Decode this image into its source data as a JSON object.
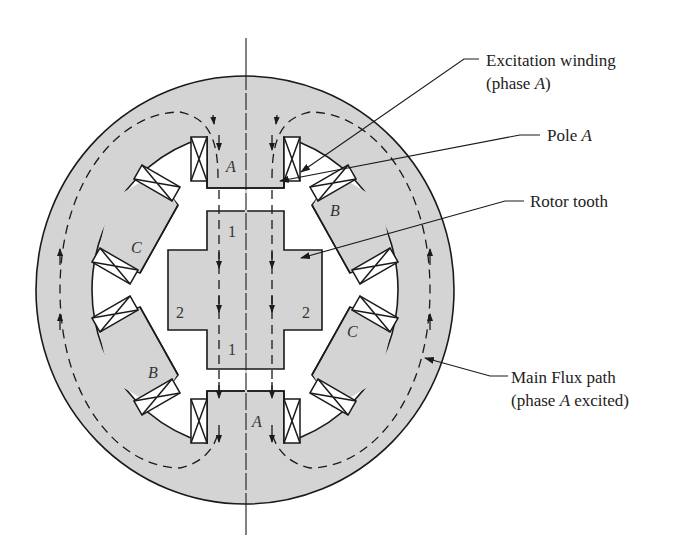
{
  "colors": {
    "iron": "#d4d4d4",
    "outline": "#1a1a1a",
    "background": "#ffffff"
  },
  "callouts": {
    "excitation_winding": {
      "line1": "Excitation winding",
      "line2_prefix": "(phase ",
      "line2_italic": "A",
      "line2_suffix": ")"
    },
    "pole_a": {
      "prefix": "Pole ",
      "italic": "A"
    },
    "rotor_tooth": {
      "text": "Rotor tooth"
    },
    "main_flux_path": {
      "line1": "Main Flux path",
      "line2_prefix": "(phase ",
      "line2_italic": "A",
      "line2_suffix": " excited)"
    }
  },
  "pole_labels": {
    "a_top": "A",
    "a_bottom": "A",
    "b_upper_right": "B",
    "b_lower_left": "B",
    "c_left": "C",
    "c_right": "C"
  },
  "rotor_labels": {
    "tooth1_top": "1",
    "tooth1_bottom": "1",
    "tooth2_left": "2",
    "tooth2_right": "2"
  }
}
